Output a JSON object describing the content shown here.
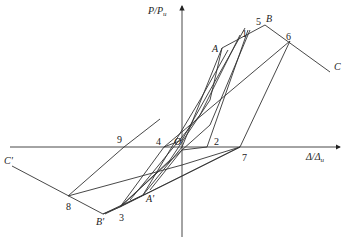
{
  "diagram": {
    "y_axis_label": "P/P",
    "y_axis_sub": "u",
    "x_axis_label": "Δ/Δ",
    "x_axis_sub": "u",
    "origin_label": "O",
    "points": {
      "A": "A",
      "A_prime": "A'",
      "B": "B",
      "B_prime": "B'",
      "C": "C",
      "C_prime": "C'",
      "p1": "1",
      "p2": "2",
      "p3": "3",
      "p4": "4",
      "p5": "5",
      "p6": "6",
      "p7": "7",
      "p8": "8",
      "p9": "9"
    }
  }
}
